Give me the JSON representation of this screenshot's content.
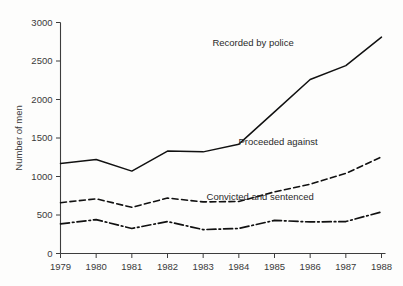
{
  "chart_data": {
    "type": "line",
    "title": "",
    "xlabel": "",
    "ylabel": "Number of men",
    "categories": [
      "1979",
      "1980",
      "1981",
      "1982",
      "1983",
      "1984",
      "1985",
      "1986",
      "1987",
      "1988"
    ],
    "x": [
      1979,
      1980,
      1981,
      1982,
      1983,
      1984,
      1985,
      1986,
      1987,
      1988
    ],
    "xlim": [
      1979,
      1988
    ],
    "ylim": [
      0,
      3000
    ],
    "yticks": [
      "0",
      "500",
      "1000",
      "1500",
      "2000",
      "2500",
      "3000"
    ],
    "ytick_values": [
      0,
      500,
      1000,
      1500,
      2000,
      2500,
      3000
    ],
    "grid": false,
    "legend_position": "inline-annotations",
    "series": [
      {
        "name": "Recorded by police",
        "style": "solid",
        "values": [
          1170,
          1220,
          1070,
          1330,
          1320,
          1420,
          1840,
          2260,
          2440,
          2810
        ]
      },
      {
        "name": "Proceeded against",
        "style": "dashed",
        "values": [
          660,
          710,
          600,
          720,
          670,
          675,
          800,
          900,
          1040,
          1255
        ]
      },
      {
        "name": "Convicted and sentenced",
        "style": "dash-dot",
        "values": [
          385,
          440,
          325,
          415,
          310,
          325,
          430,
          410,
          415,
          540
        ]
      }
    ],
    "annotations": [
      {
        "text": "Recorded by police",
        "x": 1984.4,
        "y": 2700
      },
      {
        "text": "Proceeded against",
        "x": 1985.1,
        "y": 1410
      },
      {
        "text": "Convicted and sentenced",
        "x": 1984.6,
        "y": 700
      }
    ]
  },
  "colors": {
    "line": "#111111",
    "axis": "#3d3d3d",
    "text": "#3a3a3a",
    "background": "#fdfdfc"
  }
}
